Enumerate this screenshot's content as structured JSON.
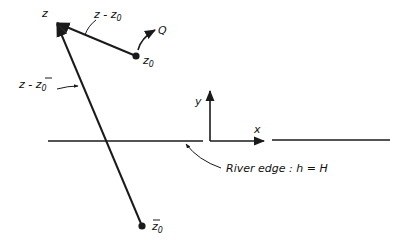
{
  "diagram": {
    "colors": {
      "ink": "#1a1a1a",
      "background": "#ffffff"
    },
    "labels": {
      "z": "z",
      "z_minus_z0_main": "z - z",
      "z_minus_z0_sub": "0",
      "z_minus_zbar0_main": "z - ",
      "z_minus_zbar0_zbar": "z",
      "z_minus_zbar0_sub": "0",
      "z0_main": "z",
      "z0_sub": "0",
      "Q": "Q",
      "zbar0_main": "z",
      "zbar0_sub": "0",
      "axis_x": "x",
      "axis_y": "y",
      "river_edge": "River edge : h = H"
    },
    "points": [
      {
        "id": "z",
        "role": "field point"
      },
      {
        "id": "z0",
        "role": "source"
      },
      {
        "id": "zbar0",
        "role": "image source"
      }
    ],
    "vectors": [
      {
        "from": "z0",
        "to": "z",
        "label": "z - z0"
      },
      {
        "from": "zbar0",
        "to": "z",
        "label": "z - z̄0"
      }
    ]
  }
}
